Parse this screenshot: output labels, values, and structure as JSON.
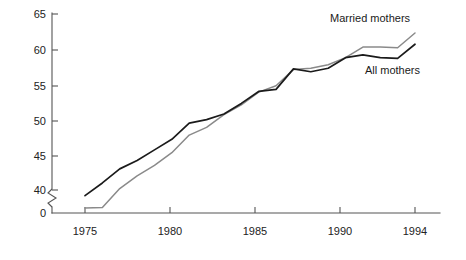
{
  "chart_data": {
    "type": "line",
    "title": "",
    "subtitle": "",
    "xlabel": "",
    "ylabel": "",
    "xlim": [
      1975,
      1994
    ],
    "ylim": [
      40,
      65
    ],
    "y_axis_break": true,
    "y_break_from": 0,
    "y_break_to": 40,
    "grid": false,
    "legend_position": "inline-annotation",
    "x_tick_labels": [
      "1975",
      "1980",
      "1985",
      "1990",
      "1994"
    ],
    "x_tick_values": [
      1975,
      1980,
      1985,
      1990,
      1994
    ],
    "y_tick_labels": [
      "0",
      "40",
      "45",
      "50",
      "55",
      "60",
      "65"
    ],
    "y_tick_values": [
      0,
      40,
      45,
      50,
      55,
      60,
      65
    ],
    "x": [
      1975,
      1976,
      1977,
      1978,
      1979,
      1980,
      1981,
      1982,
      1983,
      1984,
      1985,
      1986,
      1987,
      1988,
      1989,
      1990,
      1991,
      1992,
      1993,
      1994
    ],
    "series": [
      {
        "name": "Married mothers",
        "color": "#1b1b1b",
        "values": [
          39.2,
          41.0,
          43.0,
          44.2,
          45.7,
          47.2,
          49.5,
          50.0,
          50.8,
          52.3,
          54.0,
          54.3,
          57.2,
          56.8,
          57.3,
          58.8,
          59.2,
          58.8,
          58.7,
          60.7
        ]
      },
      {
        "name": "All mothers",
        "color": "#8a8a8a",
        "values": [
          36.6,
          37.5,
          40.2,
          42.0,
          43.5,
          45.3,
          47.8,
          48.9,
          50.7,
          52.1,
          53.9,
          54.8,
          57.1,
          57.3,
          57.8,
          58.8,
          60.3,
          60.3,
          60.2,
          62.3
        ]
      }
    ],
    "annotations": [
      {
        "id": "married-mothers-label",
        "text": "Married mothers",
        "x": 330,
        "y": 22
      },
      {
        "id": "all-mothers-label",
        "text": "All mothers",
        "x": 365,
        "y": 74
      }
    ]
  },
  "axis": {
    "y_ticks": [
      {
        "label": "65",
        "value": 65,
        "py": 14
      },
      {
        "label": "60",
        "value": 60,
        "py": 50
      },
      {
        "label": "55",
        "value": 55,
        "py": 86
      },
      {
        "label": "50",
        "value": 50,
        "py": 121
      },
      {
        "label": "45",
        "value": 45,
        "py": 156
      },
      {
        "label": "40",
        "value": 40,
        "py": 190
      },
      {
        "label": "0",
        "value": 0,
        "py": 213
      }
    ],
    "x_ticks": [
      {
        "label": "1975",
        "value": 1975,
        "px": 85
      },
      {
        "label": "1980",
        "value": 1980,
        "px": 170
      },
      {
        "label": "1985",
        "value": 1985,
        "px": 255
      },
      {
        "label": "1990",
        "value": 1990,
        "px": 340
      },
      {
        "label": "1994",
        "value": 1994,
        "px": 415
      }
    ]
  },
  "colors": {
    "married_line": "#1b1b1b",
    "all_line": "#8a8a8a",
    "axis": "#555555",
    "text": "#222222",
    "background": "#ffffff"
  }
}
